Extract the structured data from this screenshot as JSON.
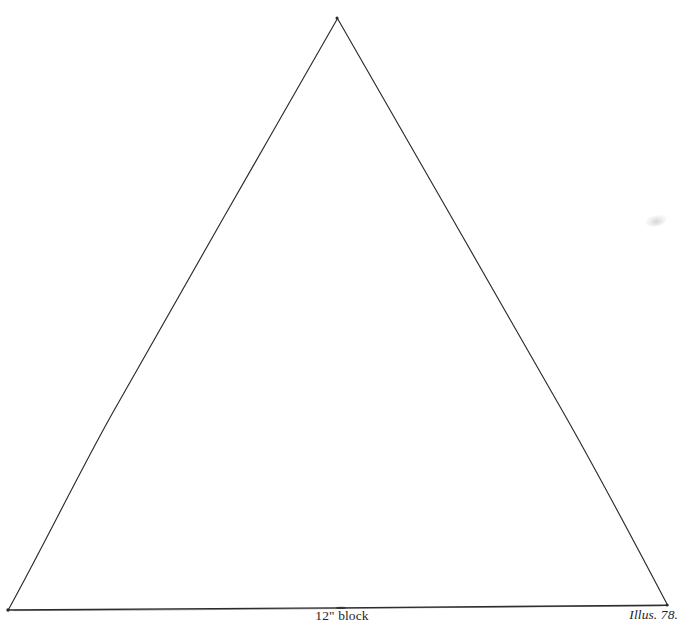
{
  "figure": {
    "kind": "line-drawing",
    "background_color": "#ffffff",
    "stroke_color": "#2b2b2b",
    "stroke_width_px": 1.2,
    "vertices": {
      "apex": {
        "x": 337,
        "y": 17
      },
      "bottom_left": {
        "x": 7,
        "y": 610
      },
      "bottom_right": {
        "x": 668,
        "y": 605
      }
    },
    "edges": [
      {
        "name": "left-edge",
        "from": "apex",
        "to": "bottom_left"
      },
      {
        "name": "right-edge",
        "from": "apex",
        "to": "bottom_right"
      },
      {
        "name": "base-edge",
        "from": "bottom_left",
        "to": "bottom_right"
      }
    ]
  },
  "labels": {
    "base_label": "12\" block",
    "illustration_label": "Illus. 78."
  },
  "artifacts": {
    "smudge_note": "faint pencil smudge, upper right"
  }
}
